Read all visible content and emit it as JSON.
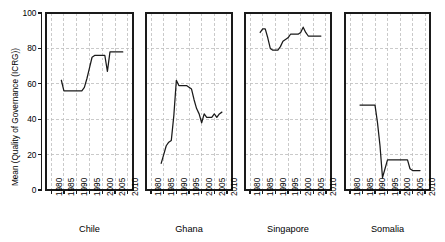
{
  "chart_data": {
    "type": "line",
    "title": "",
    "subtitle": "",
    "xlabel": "",
    "ylabel": "Mean (Quality of Governance (ICRG))",
    "xlim": [
      1978,
      2012
    ],
    "ylim": [
      0,
      100
    ],
    "grid": true,
    "legend_position": "none",
    "layout": "1x4 small multiples",
    "xticks": [
      1980,
      1985,
      1990,
      1995,
      2000,
      2005,
      2010
    ],
    "xtick_labels": [
      "1980",
      "1985",
      "1990",
      "1995",
      "2000",
      "2005",
      "2010"
    ],
    "yticks": [
      0,
      20,
      40,
      60,
      80,
      100
    ],
    "ytick_labels": [
      "0",
      "20",
      "40",
      "60",
      "80",
      "100"
    ],
    "line_color": "#1a1a1a",
    "grid_color": "#bdbdbd",
    "axis_color": "#1a1a1a",
    "panels": [
      {
        "label": "Chile",
        "x": [
          1984,
          1985,
          1986,
          1987,
          1988,
          1989,
          1990,
          1991,
          1992,
          1993,
          1994,
          1995,
          1996,
          1997,
          1998,
          1999,
          2000,
          2001,
          2002,
          2003,
          2004,
          2005,
          2006,
          2007,
          2008
        ],
        "y": [
          62,
          56,
          56,
          56,
          56,
          56,
          56,
          56,
          56,
          58,
          63,
          69,
          75,
          76,
          76,
          76,
          76,
          76,
          67,
          78,
          78,
          78,
          78,
          78,
          78
        ]
      },
      {
        "label": "Ghana",
        "x": [
          1984,
          1985,
          1986,
          1987,
          1988,
          1989,
          1990,
          1991,
          1992,
          1993,
          1994,
          1995,
          1996,
          1997,
          1998,
          1999,
          2000,
          2001,
          2002,
          2003,
          2004,
          2005,
          2006,
          2007,
          2008
        ],
        "y": [
          15,
          20,
          25,
          27,
          28,
          42,
          62,
          59,
          59,
          59,
          59,
          58,
          57,
          51,
          46,
          43,
          38,
          43,
          41,
          41,
          41,
          43,
          41,
          43,
          44
        ]
      },
      {
        "label": "Singapore",
        "x": [
          1984,
          1985,
          1986,
          1987,
          1988,
          1989,
          1990,
          1991,
          1992,
          1993,
          1994,
          1995,
          1996,
          1997,
          1998,
          1999,
          2000,
          2001,
          2002,
          2003,
          2004,
          2005,
          2006,
          2007,
          2008
        ],
        "y": [
          89,
          91,
          91,
          86,
          80,
          79,
          79,
          79,
          81,
          84,
          85,
          86,
          88,
          88,
          88,
          88,
          89,
          92,
          89,
          87,
          87,
          87,
          87,
          87,
          87
        ]
      },
      {
        "label": "Somalia",
        "x": [
          1984,
          1985,
          1986,
          1987,
          1988,
          1989,
          1990,
          1991,
          1992,
          1993,
          1994,
          1995,
          1996,
          1997,
          1998,
          1999,
          2000,
          2001,
          2002,
          2003,
          2004,
          2005,
          2006,
          2007,
          2008
        ],
        "y": [
          48,
          48,
          48,
          48,
          48,
          48,
          48,
          38,
          25,
          7,
          12,
          17,
          17,
          17,
          17,
          17,
          17,
          17,
          17,
          17,
          12,
          11,
          11,
          11,
          11
        ]
      }
    ]
  }
}
